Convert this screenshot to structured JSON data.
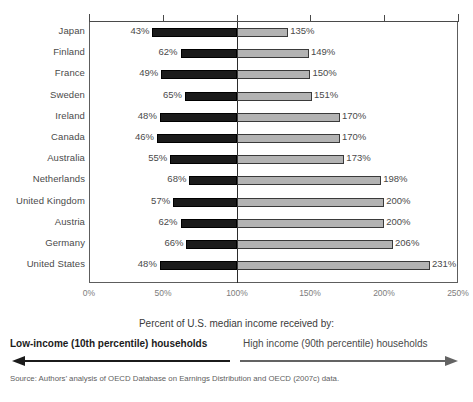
{
  "chart_data": {
    "type": "bar",
    "orientation": "horizontal",
    "layout": "diverging-paired",
    "title": "",
    "xlabel": "",
    "ylabel": "",
    "xlim": [
      0,
      250
    ],
    "grid": false,
    "legend_position": "below",
    "axis_ticks": [
      "0%",
      "50%",
      "100%",
      "150%",
      "200%",
      "250%"
    ],
    "axis_tick_values": [
      0,
      50,
      100,
      150,
      200,
      250
    ],
    "reference_line": 100,
    "categories": [
      "Japan",
      "Finland",
      "France",
      "Sweden",
      "Ireland",
      "Canada",
      "Australia",
      "Netherlands",
      "United Kingdom",
      "Austria",
      "Germany",
      "United States"
    ],
    "series": [
      {
        "name": "Low-income (10th percentile) households",
        "color": "#1b1b1b",
        "values": [
          43,
          62,
          49,
          65,
          48,
          46,
          55,
          68,
          57,
          62,
          66,
          48
        ],
        "labels": [
          "43%",
          "62%",
          "49%",
          "65%",
          "48%",
          "46%",
          "55%",
          "68%",
          "57%",
          "62%",
          "66%",
          "48%"
        ]
      },
      {
        "name": "High income (90th percentile) households",
        "color": "#b3b3b3",
        "values": [
          135,
          149,
          150,
          151,
          170,
          170,
          173,
          198,
          200,
          200,
          206,
          231
        ],
        "labels": [
          "135%",
          "149%",
          "150%",
          "151%",
          "170%",
          "170%",
          "173%",
          "198%",
          "200%",
          "200%",
          "206%",
          "231%"
        ]
      }
    ]
  },
  "annotation": {
    "title": "Percent of U.S. median income received by:",
    "left_label": "Low-income (10th percentile) households",
    "right_label": "High income (90th percentile) households",
    "left_arrow_icon": "arrow-left-icon",
    "right_arrow_icon": "arrow-right-icon"
  },
  "source": {
    "text": "Source: Authors’ analysis of OECD Database on Earnings Distribution and OECD (2007c) data."
  },
  "colors": {
    "low_income_bar": "#1b1b1b",
    "high_income_bar": "#b3b3b3",
    "bar_border": "#3a3a3a",
    "axis": "#4a4a4a",
    "text": "#4a4a4a"
  }
}
